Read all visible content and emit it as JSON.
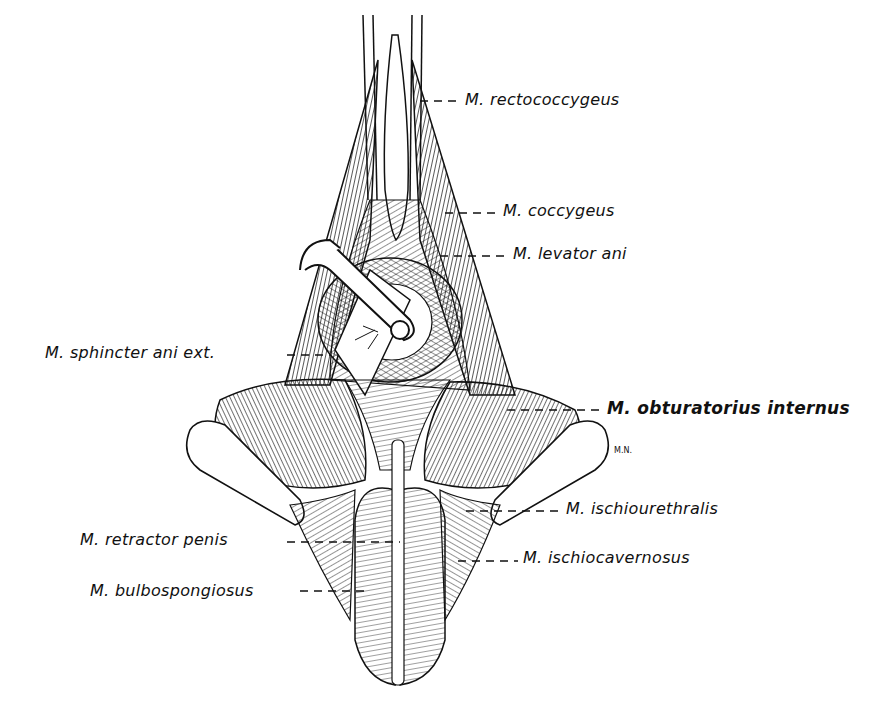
{
  "figure": {
    "type": "anatomical line illustration",
    "signature": "M.N.",
    "labels": [
      {
        "id": "rectococcygeus",
        "text": "M. rectococcygeus",
        "side": "right",
        "x": 465,
        "y": 92,
        "leader_from": [
          420,
          101
        ],
        "bold": false
      },
      {
        "id": "coccygeus",
        "text": "M. coccygeus",
        "side": "right",
        "x": 503,
        "y": 203,
        "leader_from": [
          445,
          213
        ],
        "bold": false
      },
      {
        "id": "levator-ani",
        "text": "M. levator ani",
        "side": "right",
        "x": 513,
        "y": 246,
        "leader_from": [
          440,
          256
        ],
        "bold": false
      },
      {
        "id": "sphincter-ani-ext",
        "text": "M. sphincter ani ext.",
        "side": "left",
        "x": 45,
        "y": 345,
        "leader_from": [
          330,
          355
        ],
        "bold": false
      },
      {
        "id": "obturatorius-internus",
        "text": "M. obturatorius internus",
        "side": "right",
        "x": 607,
        "y": 400,
        "leader_from": [
          507,
          410
        ],
        "bold": true
      },
      {
        "id": "ischiourethralis",
        "text": "M. ischiourethralis",
        "side": "right",
        "x": 566,
        "y": 501,
        "leader_from": [
          466,
          511
        ],
        "bold": false
      },
      {
        "id": "ischiocavernosus",
        "text": "M. ischiocavernosus",
        "side": "right",
        "x": 523,
        "y": 550,
        "leader_from": [
          458,
          561
        ],
        "bold": false
      },
      {
        "id": "retractor-penis",
        "text": "M. retractor penis",
        "side": "left",
        "x": 80,
        "y": 532,
        "leader_from": [
          400,
          542
        ],
        "bold": false
      },
      {
        "id": "bulbospongiosus",
        "text": "M. bulbospongiosus",
        "side": "left",
        "x": 90,
        "y": 583,
        "leader_from": [
          370,
          591
        ],
        "bold": false
      }
    ]
  }
}
